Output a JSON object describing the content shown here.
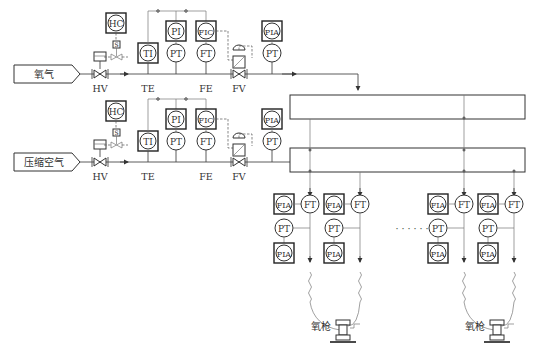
{
  "sources": [
    {
      "label": "氧气"
    },
    {
      "label": "压缩空气"
    }
  ],
  "valves": {
    "hand_valve": "HV",
    "temp_element": "TE",
    "flow_element": "FE",
    "flow_valve": "FV",
    "solenoid": "S"
  },
  "instruments": {
    "hc": "HC",
    "ti": "TI",
    "pi": "PI",
    "pt": "PT",
    "fic": "FIC",
    "ft": "FT",
    "pia": "PIA",
    "fia": "FIA"
  },
  "branches": {
    "ellipsis": "· · · · · ·",
    "lance_label": "氧枪"
  }
}
